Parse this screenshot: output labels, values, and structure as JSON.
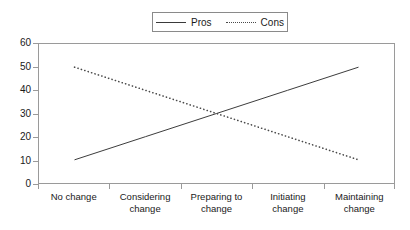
{
  "chart_data": {
    "type": "line",
    "title": "",
    "subtitle": "",
    "xlabel": "",
    "ylabel": "",
    "categories": [
      "No change",
      "Considering change",
      "Preparing to change",
      "Initiating change",
      "Maintaining change"
    ],
    "category_lines": [
      [
        "No change"
      ],
      [
        "Considering",
        "change"
      ],
      [
        "Preparing to",
        "change"
      ],
      [
        "Initiating",
        "change"
      ],
      [
        "Maintaining",
        "change"
      ]
    ],
    "series": [
      {
        "name": "Pros",
        "style": "solid",
        "color": "#3a3a3a",
        "values": [
          10,
          20,
          30,
          40,
          50
        ]
      },
      {
        "name": "Cons",
        "style": "dotted",
        "color": "#4a4a4a",
        "values": [
          50,
          40,
          30,
          20,
          10
        ]
      }
    ],
    "ylim": [
      0,
      60
    ],
    "ytick_values": [
      0,
      10,
      20,
      30,
      40,
      50,
      60
    ],
    "ytick_labels": [
      "0",
      "10",
      "20",
      "30",
      "40",
      "50",
      "60"
    ],
    "grid": false,
    "legend_position": "top-center",
    "legend_entries": [
      "Pros",
      "Cons"
    ],
    "annotations": [],
    "crossing_point": {
      "category": "Preparing to change",
      "value": 30
    }
  },
  "legend": {
    "entries": [
      {
        "label": "Pros",
        "swatch": "solid-line-swatch"
      },
      {
        "label": "Cons",
        "swatch": "dotted-line-swatch"
      }
    ]
  },
  "page_fragment": {
    "text": ""
  }
}
